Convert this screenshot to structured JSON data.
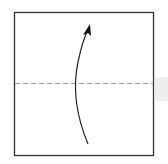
{
  "diagram": {
    "type": "origami-fold-step",
    "paper": {
      "x": 14,
      "y": 12,
      "width": 139,
      "height": 143,
      "stroke": "#333333",
      "fill": "#ffffff"
    },
    "fold_line": {
      "style": "valley-dashed",
      "y": 83,
      "color": "#999999"
    },
    "arrow": {
      "direction": "up",
      "color": "#222222"
    },
    "side_tab": {
      "color": "#eeeeee"
    }
  }
}
